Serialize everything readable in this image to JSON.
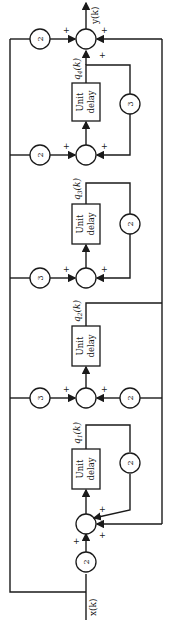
{
  "diagram": {
    "type": "block-diagram",
    "orientation": "rotated-90-ccw",
    "input_label": "x(k)",
    "output_label": "y(k)",
    "delay_label_line1": "Unit",
    "delay_label_line2": "delay",
    "plus": "+",
    "states": [
      {
        "name": "q4(k)",
        "sub": "4",
        "forward_gain": "2",
        "feedback_gain": "3"
      },
      {
        "name": "q3(k)",
        "sub": "3",
        "forward_gain": "3",
        "feedback_gain": "2"
      },
      {
        "name": "q2(k)",
        "sub": "2",
        "forward_gain": "3",
        "feedback_gain": "2"
      },
      {
        "name": "q1(k)",
        "sub": "1",
        "forward_gain": "2",
        "feedback_gain": "2"
      }
    ],
    "output_gain": "2",
    "colors": {
      "line": "#1a1a1a",
      "background": "#ffffff"
    }
  }
}
